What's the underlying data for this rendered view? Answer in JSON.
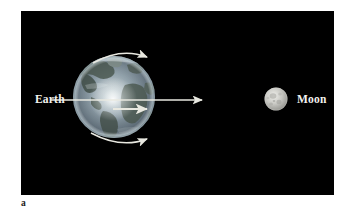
{
  "figure": {
    "caption_letter": "a",
    "panel_background": "#000000",
    "page_background": "#ffffff"
  },
  "scene": {
    "title": "Earth and Moon tidal / rotation diagram",
    "label_color": "#f2f2ee",
    "arrow_color": "#e8e8e0",
    "bodies": [
      {
        "name": "earth",
        "label": "Earth",
        "cx": 93,
        "cy": 86,
        "r": 41,
        "ocean_color": "#7d8e9a",
        "land_color": "#4d5a52",
        "highlight_color": "#e9eef0",
        "shadow_color": "#10151a"
      },
      {
        "name": "moon",
        "label": "Moon",
        "cx": 255,
        "cy": 88,
        "r": 11.5,
        "surface_color": "#c8c8c4",
        "crater_color": "#9d9d99",
        "highlight_color": "#eeeeea",
        "shadow_color": "#6a6a66"
      }
    ],
    "arrows": [
      {
        "name": "earth-rotation-top",
        "description": "curved arrow along upper-right limb of Earth, pointing up-right",
        "type": "curved"
      },
      {
        "name": "earth-orbit-vector",
        "description": "long straight arrow from Earth center pointing right toward the Moon",
        "type": "straight",
        "x1": 30,
        "y1": 89,
        "x2": 182,
        "y2": 89
      },
      {
        "name": "earth-tidal-vector",
        "description": "short straight arrow below center pointing right",
        "type": "straight",
        "x1": 92,
        "y1": 97,
        "x2": 127,
        "y2": 97
      },
      {
        "name": "earth-rotation-bottom",
        "description": "curved arrow along lower-right limb of Earth, pointing down-right",
        "type": "curved"
      }
    ]
  }
}
